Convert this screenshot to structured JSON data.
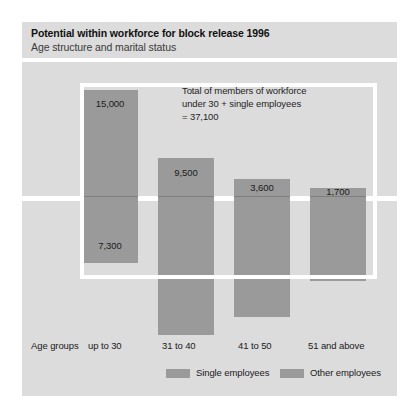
{
  "title": {
    "main": "Potential within workforce for block release 1996",
    "subtitle": "Age structure and marital status"
  },
  "annotation": {
    "line1": "Total of members of workforce",
    "line2": "under 30 + single employees",
    "line3": "= 37,100"
  },
  "axis": {
    "group_caption": "Age groups"
  },
  "legend": {
    "items": [
      {
        "label": "Single employees",
        "color": "#9a9a9a"
      },
      {
        "label": "Other employees",
        "color": "#9a9a9a"
      }
    ]
  },
  "colors": {
    "panel_background": "#dcdcdc",
    "bar_other": "#9a9a9a",
    "bar_single": "#9a9a9a",
    "callout_outline": "#ffffff",
    "page_background": "#ffffff"
  },
  "chart_data": {
    "type": "bar",
    "title": "Potential within workforce for block release 1996",
    "subtitle": "Age structure and marital status",
    "xlabel": "Age groups",
    "ylabel": "",
    "stacked": true,
    "grid": false,
    "legend_position": "bottom",
    "categories": [
      "up to 30",
      "31 to 40",
      "41 to 50",
      "51 and above"
    ],
    "series": [
      {
        "name": "Other employees",
        "values": [
          15000,
          9500,
          3600,
          1700
        ]
      },
      {
        "name": "Single employees",
        "values": [
          7300,
          null,
          null,
          null
        ]
      }
    ],
    "labels": {
      "up to 30": {
        "other": "15,000",
        "single": "7,300"
      },
      "31 to 40": {
        "other": "9,500"
      },
      "41 to 50": {
        "other": "3,600"
      },
      "51 and above": {
        "other": "1,700"
      }
    },
    "annotation": "Total of members of workforce under 30 + single employees = 37,100",
    "annotation_value": 37100
  },
  "bars": [
    {
      "name": "up to 30",
      "left": 60,
      "width": 56,
      "other": {
        "top": 28,
        "height": 106,
        "label": "15,000",
        "label_top": 8
      },
      "single": {
        "top": 134,
        "height": 66,
        "label": "7,300",
        "label_top": 44
      }
    },
    {
      "name": "31 to 40",
      "left": 136,
      "width": 56,
      "other": {
        "top": 96,
        "height": 38,
        "label": "9,500",
        "label_top": 9
      },
      "single": {
        "top": 134,
        "height": 138,
        "label": "",
        "label_top": 0
      }
    },
    {
      "name": "41 to 50",
      "left": 212,
      "width": 56,
      "other": {
        "top": 117,
        "height": 17,
        "label": "3,600",
        "label_top": 3
      },
      "single": {
        "top": 134,
        "height": 120,
        "label": "",
        "label_top": 0
      }
    },
    {
      "name": "51 and above",
      "left": 288,
      "width": 56,
      "other": {
        "top": 126,
        "height": 8,
        "label": "1,700",
        "label_top": -2
      },
      "single": {
        "top": 134,
        "height": 84,
        "label": "",
        "label_top": 0
      }
    }
  ],
  "axis_positions": [
    {
      "label": "Age groups",
      "left": 9
    },
    {
      "label": "up to 30",
      "left": 66
    },
    {
      "label": "31 to 40",
      "left": 140
    },
    {
      "label": "41 to 50",
      "left": 216
    },
    {
      "label": "51 and above",
      "left": 286
    }
  ],
  "legend_positions": [
    {
      "swatch_left": 144,
      "text_left": 174
    },
    {
      "swatch_left": 258,
      "text_left": 288
    }
  ]
}
